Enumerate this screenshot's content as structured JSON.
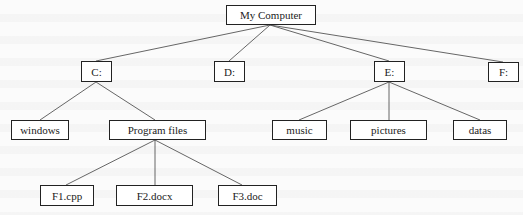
{
  "diagram": {
    "type": "tree",
    "root": "My Computer",
    "nodes": [
      {
        "id": "root",
        "label": "My Computer",
        "x": 226,
        "y": 5,
        "w": 90,
        "h": 20
      },
      {
        "id": "c",
        "label": "C:",
        "x": 81,
        "y": 61,
        "w": 31,
        "h": 21
      },
      {
        "id": "d",
        "label": "D:",
        "x": 214,
        "y": 61,
        "w": 31,
        "h": 21
      },
      {
        "id": "e",
        "label": "E:",
        "x": 374,
        "y": 61,
        "w": 31,
        "h": 21
      },
      {
        "id": "f",
        "label": "F:",
        "x": 488,
        "y": 62,
        "w": 31,
        "h": 20
      },
      {
        "id": "windows",
        "label": "windows",
        "x": 11,
        "y": 120,
        "w": 58,
        "h": 20
      },
      {
        "id": "programfiles",
        "label": "Program files",
        "x": 109,
        "y": 120,
        "w": 97,
        "h": 20
      },
      {
        "id": "music",
        "label": "music",
        "x": 272,
        "y": 120,
        "w": 55,
        "h": 20
      },
      {
        "id": "pictures",
        "label": "pictures",
        "x": 350,
        "y": 120,
        "w": 77,
        "h": 20
      },
      {
        "id": "datas",
        "label": "datas",
        "x": 453,
        "y": 120,
        "w": 54,
        "h": 20
      },
      {
        "id": "f1",
        "label": "F1.cpp",
        "x": 40,
        "y": 185,
        "w": 54,
        "h": 21
      },
      {
        "id": "f2",
        "label": "F2.docx",
        "x": 116,
        "y": 185,
        "w": 77,
        "h": 21
      },
      {
        "id": "f3",
        "label": "F3.doc",
        "x": 218,
        "y": 185,
        "w": 59,
        "h": 21
      }
    ],
    "edges": [
      {
        "from": "root",
        "to": "c",
        "x1": 270,
        "y1": 25,
        "x2": 96,
        "y2": 61
      },
      {
        "from": "root",
        "to": "d",
        "x1": 270,
        "y1": 25,
        "x2": 229,
        "y2": 61
      },
      {
        "from": "root",
        "to": "e",
        "x1": 270,
        "y1": 25,
        "x2": 389,
        "y2": 61
      },
      {
        "from": "root",
        "to": "f",
        "x1": 270,
        "y1": 25,
        "x2": 503,
        "y2": 62
      },
      {
        "from": "c",
        "to": "windows",
        "x1": 96,
        "y1": 82,
        "x2": 40,
        "y2": 120
      },
      {
        "from": "c",
        "to": "programfiles",
        "x1": 96,
        "y1": 82,
        "x2": 155,
        "y2": 120
      },
      {
        "from": "e",
        "to": "music",
        "x1": 389,
        "y1": 82,
        "x2": 299,
        "y2": 120
      },
      {
        "from": "e",
        "to": "pictures",
        "x1": 389,
        "y1": 82,
        "x2": 389,
        "y2": 120
      },
      {
        "from": "e",
        "to": "datas",
        "x1": 389,
        "y1": 82,
        "x2": 480,
        "y2": 120
      },
      {
        "from": "programfiles",
        "to": "f1",
        "x1": 155,
        "y1": 140,
        "x2": 66,
        "y2": 185
      },
      {
        "from": "programfiles",
        "to": "f2",
        "x1": 155,
        "y1": 140,
        "x2": 155,
        "y2": 185
      },
      {
        "from": "programfiles",
        "to": "f3",
        "x1": 155,
        "y1": 140,
        "x2": 242,
        "y2": 185
      }
    ],
    "colors": {
      "line": "#555555",
      "border": "#222222",
      "text": "#222222"
    }
  }
}
